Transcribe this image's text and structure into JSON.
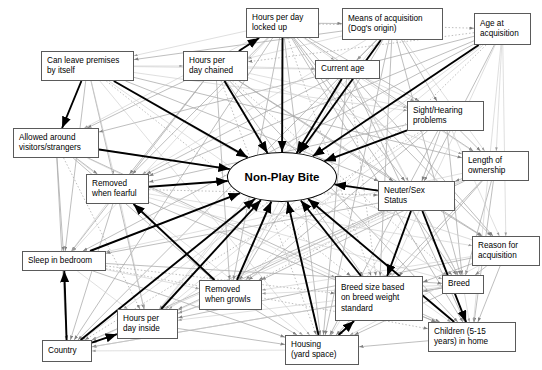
{
  "diagram": {
    "type": "bayesian-network",
    "title": "Non-Play Bite",
    "background_color": "#ffffff",
    "node_border_color": "#5a5a5a",
    "strong_edge_color": "#000000",
    "weak_edge_color": "#b4b4b4",
    "center_node": {
      "id": "non_play_bite",
      "label": "Non-Play Bite",
      "shape": "ellipse",
      "cx": 282,
      "cy": 177,
      "rx": 55,
      "ry": 25
    },
    "nodes": [
      {
        "id": "hours_locked_up",
        "label": "Hours per day\nlocked up",
        "x": 246,
        "y": 8,
        "w": 73,
        "h": 30
      },
      {
        "id": "means_acq",
        "label": "Means of acquisition\n(Dog's origin)",
        "x": 342,
        "y": 8,
        "w": 101,
        "h": 32
      },
      {
        "id": "age_acq",
        "label": "Age at\nacquisition",
        "x": 474,
        "y": 13,
        "w": 57,
        "h": 32
      },
      {
        "id": "can_leave",
        "label": "Can leave premises\nby itself",
        "x": 41,
        "y": 51,
        "w": 93,
        "h": 30
      },
      {
        "id": "hours_chained",
        "label": "Hours per\nday chained",
        "x": 183,
        "y": 51,
        "w": 65,
        "h": 30
      },
      {
        "id": "current_age",
        "label": "Current age",
        "x": 315,
        "y": 60,
        "w": 65,
        "h": 19
      },
      {
        "id": "sight_hearing",
        "label": "Sight/Hearing\nproblems",
        "x": 407,
        "y": 101,
        "w": 77,
        "h": 30
      },
      {
        "id": "allowed_around",
        "label": "Allowed around\nvisitors/strangers",
        "x": 13,
        "y": 128,
        "w": 86,
        "h": 30
      },
      {
        "id": "length_ownership",
        "label": "Length of\nownership",
        "x": 462,
        "y": 151,
        "w": 67,
        "h": 30
      },
      {
        "id": "removed_fearful",
        "label": "Removed\nwhen fearful",
        "x": 86,
        "y": 174,
        "w": 63,
        "h": 30
      },
      {
        "id": "neuter_sex",
        "label": "Neuter/Sex\nStatus",
        "x": 378,
        "y": 181,
        "w": 77,
        "h": 30
      },
      {
        "id": "sleep_bedroom",
        "label": "Sleep in bedroom",
        "x": 22,
        "y": 251,
        "w": 84,
        "h": 20
      },
      {
        "id": "reason_acq",
        "label": "Reason for\nacquisition",
        "x": 472,
        "y": 236,
        "w": 68,
        "h": 30
      },
      {
        "id": "breed",
        "label": "Breed",
        "x": 442,
        "y": 275,
        "w": 42,
        "h": 19
      },
      {
        "id": "breed_size",
        "label": "Breed size based\non breed weight\nstandard",
        "x": 335,
        "y": 276,
        "w": 88,
        "h": 45
      },
      {
        "id": "removed_growls",
        "label": "Removed\nwhen growls",
        "x": 199,
        "y": 280,
        "w": 63,
        "h": 30
      },
      {
        "id": "hours_inside",
        "label": "Hours per\nday inside",
        "x": 117,
        "y": 309,
        "w": 61,
        "h": 30
      },
      {
        "id": "children",
        "label": "Children (5-15\nyears) in home",
        "x": 428,
        "y": 322,
        "w": 88,
        "h": 30
      },
      {
        "id": "housing",
        "label": "Housing\n(yard space)",
        "x": 285,
        "y": 335,
        "w": 74,
        "h": 30
      },
      {
        "id": "country",
        "label": "Country",
        "x": 42,
        "y": 340,
        "w": 50,
        "h": 22
      }
    ],
    "strong_edges": [
      {
        "from": "can_leave",
        "to": "non_play_bite"
      },
      {
        "from": "allowed_around",
        "to": "non_play_bite"
      },
      {
        "from": "hours_chained",
        "to": "non_play_bite"
      },
      {
        "from": "hours_locked_up",
        "to": "non_play_bite"
      },
      {
        "from": "means_acq",
        "to": "non_play_bite"
      },
      {
        "from": "current_age",
        "to": "non_play_bite"
      },
      {
        "from": "sight_hearing",
        "to": "non_play_bite"
      },
      {
        "from": "age_acq",
        "to": "non_play_bite"
      },
      {
        "from": "neuter_sex",
        "to": "non_play_bite"
      },
      {
        "from": "removed_growls",
        "to": "non_play_bite"
      },
      {
        "from": "hours_inside",
        "to": "non_play_bite"
      },
      {
        "from": "sleep_bedroom",
        "to": "non_play_bite"
      },
      {
        "from": "country",
        "to": "non_play_bite"
      },
      {
        "from": "housing",
        "to": "non_play_bite"
      },
      {
        "from": "breed_size",
        "to": "non_play_bite"
      },
      {
        "from": "children",
        "to": "non_play_bite"
      },
      {
        "from": "removed_fearful",
        "to": "non_play_bite"
      },
      {
        "from": "can_leave",
        "to": "allowed_around"
      },
      {
        "from": "country",
        "to": "sleep_bedroom"
      },
      {
        "from": "country",
        "to": "hours_inside"
      },
      {
        "from": "removed_growls",
        "to": "removed_fearful"
      },
      {
        "from": "neuter_sex",
        "to": "breed_size"
      },
      {
        "from": "neuter_sex",
        "to": "children"
      },
      {
        "from": "housing",
        "to": "breed_size"
      },
      {
        "from": "hours_chained",
        "to": "hours_locked_up"
      }
    ]
  }
}
